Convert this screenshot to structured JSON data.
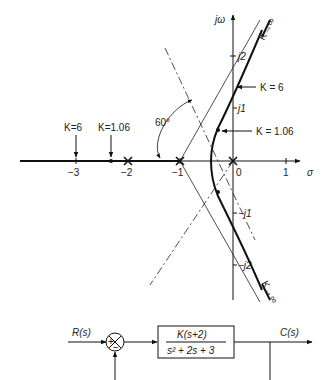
{
  "root_locus": {
    "axes": {
      "imag_label": "jω",
      "real_label": "σ",
      "real_ticks": [
        {
          "value": -3,
          "label": "−3"
        },
        {
          "value": -2,
          "label": "−2"
        },
        {
          "value": -1,
          "label": "−1"
        },
        {
          "value": 0,
          "label": "0"
        },
        {
          "value": 1,
          "label": "1"
        }
      ],
      "imag_ticks": [
        {
          "value": 2,
          "label": "j2"
        },
        {
          "value": 1,
          "label": "j1"
        },
        {
          "value": -1,
          "label": "−j1"
        },
        {
          "value": -2,
          "label": "−j2"
        }
      ]
    },
    "annotations": {
      "k_inf_upper": "K→∞",
      "k_inf_lower": "K→∞",
      "k6_imag": "K = 6",
      "k106_imag": "K = 1.06",
      "k6_real": "K=6",
      "k106_real": "K=1.06",
      "angle": "60°"
    },
    "poles": [
      "0",
      "-1",
      "-2"
    ],
    "stroke_color": "#111111"
  },
  "block_diagram": {
    "input": "R(s)",
    "output": "C(s)",
    "sum_plus": "+",
    "sum_minus": "−",
    "tf_numerator": "K(s+2)",
    "tf_denominator": "s² + 2s + 3"
  }
}
